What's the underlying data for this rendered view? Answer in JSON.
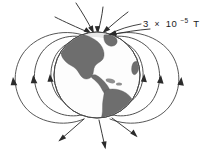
{
  "figure": {
    "name": "earth-magnetic-field-diagram",
    "background_color": "#ffffff"
  },
  "annotation": {
    "coefficient": "3",
    "times_symbol": "×",
    "base": "10",
    "exponent": "−5",
    "unit": "T",
    "full_text": "3 × 10−5 T",
    "leader_target": "north-magnetic-pole"
  },
  "globe": {
    "label": "earth-globe",
    "center_x": 97,
    "center_y": 75,
    "radius": 43,
    "ocean_color": "#fdfdfd",
    "land_color": "#6e6e6e",
    "outline_color": "#4a4a4a",
    "continents": [
      "North America",
      "Central America",
      "South America",
      "Greenland"
    ]
  },
  "field": {
    "line_color": "#3c3c3c",
    "arrow_color": "#2b2b2b",
    "description": "dipole magnetic field lines",
    "loop_count_per_side": 3,
    "north_pole_flow": "inward",
    "south_pole_flow": "outward",
    "field_strength": "3 × 10−5 T"
  },
  "icons": {
    "arrow_north_in": "arrow-into-north-pole",
    "arrow_south_out": "arrow-out-of-south-pole",
    "arrow_loop_left": "arrow-upward-left-loop",
    "arrow_loop_right": "arrow-upward-right-loop"
  }
}
